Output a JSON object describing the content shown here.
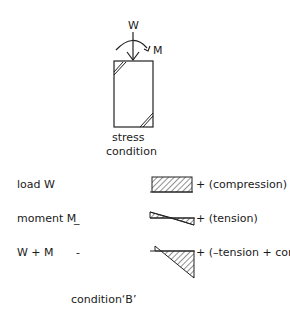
{
  "column": {
    "load_label": "W",
    "moment_label": "M",
    "caption_line1": "stress",
    "caption_line2": "condition"
  },
  "rows": [
    {
      "label": "load W",
      "dash": "",
      "result": "+ (compression)"
    },
    {
      "label": "moment M",
      "dash": "_",
      "result": "+ (tension)"
    },
    {
      "label": "W + M",
      "dash": "-",
      "result": "+ (–tension + compression)"
    }
  ],
  "footer": {
    "caption": "condition‘B’"
  }
}
